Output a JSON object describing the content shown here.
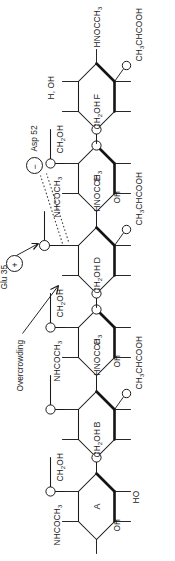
{
  "figure": {
    "orientation_deg": -90,
    "rings": [
      {
        "id": "A",
        "label": "A",
        "substituents": [
          "NHCOCH3",
          "OH",
          "HO",
          "CH2OH"
        ]
      },
      {
        "id": "B",
        "label": "B",
        "substituents": [
          "CH2OH",
          "HNOCCH3",
          "CH3CHCOOH"
        ]
      },
      {
        "id": "C",
        "label": "C",
        "substituents": [
          "NHCOCH3",
          "OH",
          "CH2OH"
        ]
      },
      {
        "id": "D",
        "label": "D",
        "substituents": [
          "CH2OH",
          "HNOCCH3",
          "CH3CHCOOH"
        ]
      },
      {
        "id": "E",
        "label": "E",
        "substituents": [
          "NHCOCH3",
          "OH",
          "CH2OH"
        ]
      },
      {
        "id": "F",
        "label": "F",
        "substituents": [
          "CH2OH",
          "H, OH",
          "HNOCCH3",
          "CH3CHCOOH"
        ]
      }
    ],
    "residues": [
      {
        "name": "Glu 35",
        "charge": "+",
        "charge_glyph": "+"
      },
      {
        "name": "Asp 52",
        "charge": "−",
        "charge_glyph": "−"
      }
    ],
    "annotations": [
      {
        "text": "Overcrowding",
        "points_to": "D"
      }
    ],
    "atoms": {
      "oxygen": "O",
      "hydroxyl": "OH",
      "hydroxyl_reversed": "HO",
      "hydroxymethyl": "CH2OH",
      "acetamido": "NHCOCH3",
      "acetamido_reversed": "HNOCCH3",
      "lactyl": "CH3CHCOOH",
      "hydrogen_hydroxyl": "H, OH"
    }
  }
}
